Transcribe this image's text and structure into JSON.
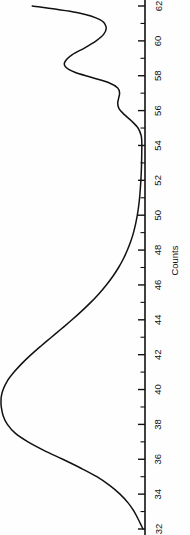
{
  "figure": {
    "background_color": "#fefefe",
    "ink_color": "#111111",
    "orientation": "rotated-90-clockwise"
  },
  "axis": {
    "title": "Counts",
    "title_value_position": 47.4,
    "labels": [
      "62",
      "60",
      "58",
      "56",
      "54",
      "52",
      "50",
      "48",
      "46",
      "44",
      "42",
      "40",
      "38",
      "36",
      "34",
      "32"
    ]
  },
  "chart_data": {
    "type": "line",
    "title": "",
    "subtitle": "",
    "xlabel": "",
    "ylabel": "Counts",
    "grid": false,
    "legend": null,
    "orientation": "horizontal-baseline-rotated",
    "axis_variable": "channel",
    "axis_range": [
      32,
      62
    ],
    "axis_tick_major_step": 2,
    "axis_tick_minor_step": 1,
    "axis_major_ticks": [
      62,
      60,
      58,
      56,
      54,
      52,
      50,
      48,
      46,
      44,
      42,
      40,
      38,
      36,
      34,
      32
    ],
    "axis_minor_ticks": [
      61,
      59,
      57,
      55,
      53,
      51,
      49,
      47,
      45,
      43,
      41,
      39,
      37,
      35,
      33
    ],
    "intensity_range": [
      0,
      1
    ],
    "annotations": [],
    "series": [
      {
        "name": "spectrum",
        "color": "#111111",
        "x": [
          32.0,
          32.2,
          32.5,
          33.0,
          33.5,
          34.0,
          34.5,
          35.0,
          35.5,
          36.0,
          36.5,
          37.0,
          37.5,
          38.0,
          38.5,
          39.0,
          39.3,
          39.6,
          40.0,
          40.5,
          41.0,
          41.5,
          42.0,
          42.5,
          43.0,
          43.5,
          44.0,
          44.5,
          45.0,
          45.5,
          46.0,
          46.5,
          47.0,
          47.5,
          48.0,
          48.5,
          49.0,
          49.5,
          50.0,
          50.5,
          51.0,
          51.5,
          52.0,
          52.5,
          53.0,
          53.5,
          54.0,
          54.3,
          54.6,
          55.0,
          55.4,
          55.8,
          56.1,
          56.4,
          56.7,
          57.0,
          57.3,
          57.6,
          57.9,
          58.2,
          58.5,
          58.8,
          59.2,
          59.6,
          60.0,
          60.4,
          60.8,
          61.2,
          61.6,
          62.0
        ],
        "y": [
          0.0,
          0.012,
          0.03,
          0.062,
          0.105,
          0.162,
          0.235,
          0.325,
          0.44,
          0.565,
          0.695,
          0.81,
          0.9,
          0.955,
          0.985,
          0.998,
          1.0,
          0.998,
          0.985,
          0.955,
          0.908,
          0.852,
          0.788,
          0.718,
          0.645,
          0.572,
          0.5,
          0.432,
          0.368,
          0.31,
          0.258,
          0.212,
          0.172,
          0.138,
          0.11,
          0.086,
          0.067,
          0.052,
          0.04,
          0.031,
          0.024,
          0.019,
          0.015,
          0.012,
          0.01,
          0.009,
          0.008,
          0.009,
          0.014,
          0.035,
          0.08,
          0.135,
          0.168,
          0.178,
          0.172,
          0.165,
          0.178,
          0.24,
          0.36,
          0.48,
          0.545,
          0.55,
          0.5,
          0.41,
          0.33,
          0.275,
          0.26,
          0.3,
          0.45,
          0.78
        ]
      }
    ],
    "peaks": [
      {
        "label": "main-peak",
        "center": 39.3,
        "relative_height": 1.0
      },
      {
        "label": "secondary-peak",
        "center": 58.6,
        "relative_height": 0.55
      },
      {
        "label": "shoulder-peak",
        "center": 56.3,
        "relative_height": 0.18
      },
      {
        "label": "edge-rise",
        "center": 62.0,
        "relative_height": 0.78
      }
    ]
  }
}
